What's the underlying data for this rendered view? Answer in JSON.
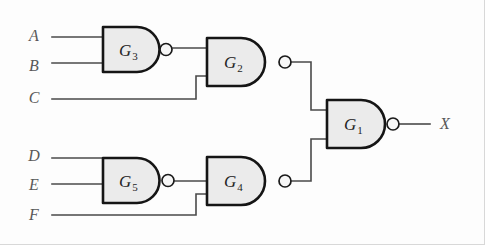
{
  "figure": {
    "background_color": "#fdfdfd",
    "gate_fill_color": "#ebebeb",
    "gate_stroke_color": "#151515",
    "wire_color": "#4a4a4a",
    "label_color": "#585858"
  },
  "inputs": [
    {
      "id": "A",
      "label": "A",
      "x": 34,
      "y": 41,
      "wire_y": 37
    },
    {
      "id": "B",
      "label": "B",
      "x": 34,
      "y": 71,
      "wire_y": 63
    },
    {
      "id": "C",
      "label": "C",
      "x": 34,
      "y": 103,
      "wire_y": 99
    },
    {
      "id": "D",
      "label": "D",
      "x": 34,
      "y": 161,
      "wire_y": 158
    },
    {
      "id": "E",
      "label": "E",
      "x": 34,
      "y": 190,
      "wire_y": 184
    },
    {
      "id": "F",
      "label": "F",
      "x": 34,
      "y": 220,
      "wire_y": 215
    }
  ],
  "outputs": [
    {
      "id": "X",
      "label": "X",
      "x": 440,
      "y": 129
    }
  ],
  "gates": [
    {
      "id": "G1",
      "label": "G",
      "subscript": "1",
      "type": "NAND",
      "x": 327,
      "y": 100,
      "width": 58,
      "height": 48,
      "label_x": 344,
      "label_y": 130,
      "inputs": [
        "G2",
        "G4"
      ],
      "output": "X"
    },
    {
      "id": "G2",
      "label": "G",
      "subscript": "2",
      "type": "NAND",
      "x": 207,
      "y": 38,
      "width": 58,
      "height": 48,
      "label_x": 224,
      "label_y": 68,
      "inputs": [
        "G3",
        "C"
      ],
      "output": "G1"
    },
    {
      "id": "G3",
      "label": "G",
      "subscript": "3",
      "type": "NAND",
      "x": 103,
      "y": 27,
      "width": 57,
      "height": 45,
      "label_x": 119,
      "label_y": 56,
      "inputs": [
        "A",
        "B"
      ],
      "output": "G2"
    },
    {
      "id": "G4",
      "label": "G",
      "subscript": "4",
      "type": "NAND",
      "x": 207,
      "y": 157,
      "width": 58,
      "height": 48,
      "label_x": 224,
      "label_y": 187,
      "inputs": [
        "G5",
        "F"
      ],
      "output": "G1"
    },
    {
      "id": "G5",
      "label": "G",
      "subscript": "5",
      "type": "NAND",
      "x": 103,
      "y": 158,
      "width": 57,
      "height": 45,
      "label_x": 119,
      "label_y": 187,
      "inputs": [
        "D",
        "E"
      ],
      "output": "G4"
    }
  ],
  "wires": [
    {
      "name": "wire-a-to-g3",
      "path": "M52,37 L103,37"
    },
    {
      "name": "wire-b-to-g3",
      "path": "M52,63 L103,63"
    },
    {
      "name": "wire-g3-to-g2",
      "path": "M173,48 L207,48"
    },
    {
      "name": "wire-c-to-g2",
      "path": "M52,99 L196,99 L196,76 L207,76"
    },
    {
      "name": "wire-g2-to-g1",
      "path": "M292,62 L311,62 L311,110 L327,110"
    },
    {
      "name": "wire-d-to-g5",
      "path": "M52,158 L103,158"
    },
    {
      "name": "wire-e-to-g5",
      "path": "M52,184 L103,184"
    },
    {
      "name": "wire-g5-to-g4",
      "path": "M175,181 L207,181"
    },
    {
      "name": "wire-f-to-g4",
      "path": "M52,215 L196,215 L196,194 L207,194"
    },
    {
      "name": "wire-g4-to-g1",
      "path": "M292,181 L311,181 L311,139 L327,139"
    },
    {
      "name": "wire-g1-to-x",
      "path": "M400,124 L430,124"
    }
  ]
}
